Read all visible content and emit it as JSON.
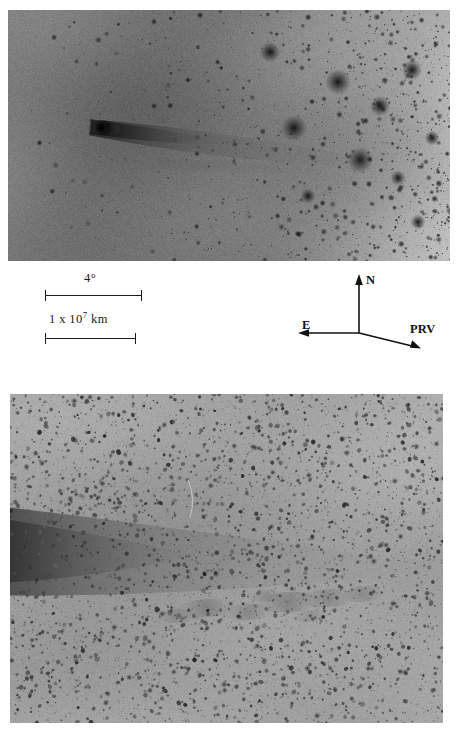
{
  "figure": {
    "type": "astronomical-image-figure",
    "panel_count": 2,
    "orientation": "vertical-stack"
  },
  "panels": [
    {
      "id": "top",
      "name": "wide-field-comet-image",
      "description": "Negative grayscale wide-field photograph of a comet with bright condensed nucleus and dust tail extending toward the lower right, set against a dense star field.",
      "rect": {
        "x": 8,
        "y": 10,
        "width": 442,
        "height": 251
      },
      "background_tone": "#9a9a9a",
      "comet": {
        "nucleus_x": 96,
        "nucleus_y": 118,
        "tail_direction": "right-down"
      }
    },
    {
      "id": "bottom",
      "name": "deep-exposure-tail-image",
      "description": "Negative grayscale deep-exposure photograph showing a broad diffuse tail band across the upper left and a knotted condensation near the center right.",
      "rect": {
        "x": 10,
        "y": 394,
        "width": 433,
        "height": 329
      },
      "background_tone": "#a8a8a8"
    }
  ],
  "scale_bars": [
    {
      "id": "angular",
      "label": "4°",
      "label_plain": "4 degrees",
      "bar_start_x": 45,
      "bar_end_x": 142,
      "bar_y": 295
    },
    {
      "id": "linear",
      "label_mantissa": "1 x 10",
      "label_exponent": "7",
      "label_unit": "km",
      "label_plain": "1 x 10^7 km",
      "bar_start_x": 45,
      "bar_end_x": 136,
      "bar_y": 338
    }
  ],
  "compass": {
    "origin_x": 359,
    "origin_y": 333,
    "arrows": [
      {
        "id": "north",
        "label": "N",
        "direction": "up",
        "tip_x": 359,
        "tip_y": 277
      },
      {
        "id": "east",
        "label": "E",
        "direction": "left",
        "tip_x": 301,
        "tip_y": 333
      },
      {
        "id": "prv",
        "label": "PRV",
        "direction": "down-right",
        "tip_x": 420,
        "tip_y": 348
      }
    ]
  },
  "colors": {
    "ink": "#1a1a1a",
    "paper": "#ffffff",
    "panel_top_base": "#9a9a9a",
    "panel_bottom_base": "#a8a8a8"
  }
}
